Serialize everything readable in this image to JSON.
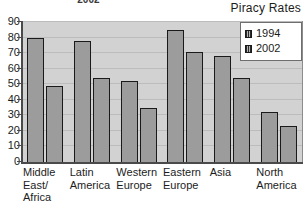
{
  "caption": {
    "text_prefix": "in 1994 to 49% in ",
    "text_bold": "2002",
    "text_suffix": "."
  },
  "chart_data": {
    "type": "bar",
    "title": "Piracy Rates",
    "xlabel": "",
    "ylabel": "",
    "ylim": [
      0,
      90
    ],
    "ytick_step": 10,
    "grid": true,
    "legend_position": "top-right",
    "categories": [
      "Middle\nEast/\nAfrica",
      "Latin\nAmerica",
      "Western\nEurope",
      "Eastern\nEurope",
      "Asia",
      "North\nAmerica"
    ],
    "ytick_labels": [
      "90",
      "80",
      "70",
      "60",
      "50",
      "40",
      "30",
      "20",
      "10",
      "0"
    ],
    "series": [
      {
        "name": "1994",
        "color": "#9c9c9c",
        "values": [
          80,
          78,
          52,
          85,
          68,
          32
        ]
      },
      {
        "name": "2002",
        "color": "#9c9c9c",
        "values": [
          49,
          54,
          35,
          71,
          54,
          23
        ]
      }
    ]
  },
  "colors": {
    "plot_background": "#d2d2d2",
    "bar_fill": "#9c9c9c",
    "bar_outline": "#1a1a1a",
    "gridline": "#bcbcbc",
    "axis": "#4a4a4a",
    "text": "#1c1c1c"
  }
}
